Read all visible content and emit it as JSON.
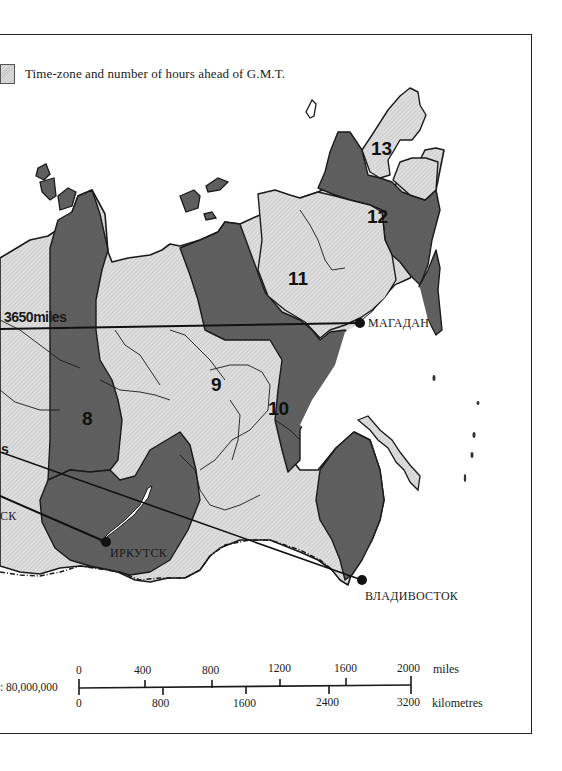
{
  "legend": {
    "text": "Time-zone and number of hours ahead of G.M.T.",
    "swatch": "hatched-light-gray"
  },
  "zones": [
    {
      "label": "8",
      "shade": "dark"
    },
    {
      "label": "9",
      "shade": "light"
    },
    {
      "label": "10",
      "shade": "dark"
    },
    {
      "label": "11",
      "shade": "light"
    },
    {
      "label": "12",
      "shade": "dark"
    },
    {
      "label": "13",
      "shade": "light"
    }
  ],
  "cities": {
    "magadan": "МАГАДАН",
    "irkutsk": "ИРКУТСК",
    "vladivostok": "ВЛАДИВОСТОК",
    "partial_left": "СК"
  },
  "distances": {
    "magadan_line": "3650miles",
    "partial_left": "s"
  },
  "scale": {
    "ratio": ": 80,000,000",
    "miles_ticks": [
      "0",
      "400",
      "800",
      "1200",
      "1600",
      "2000"
    ],
    "miles_unit": "miles",
    "km_ticks": [
      "0",
      "800",
      "1600",
      "2400",
      "3200"
    ],
    "km_unit": "kilometres"
  },
  "colors": {
    "dark_zone": "#5e5e5e",
    "light_zone": "#d6d6d6",
    "border": "#1a1a1a",
    "sea": "#ffffff"
  }
}
